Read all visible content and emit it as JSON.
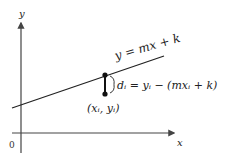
{
  "diagram": {
    "type": "least-squares-regression",
    "axes": {
      "x_label": "x",
      "y_label": "y",
      "origin_label": "0"
    },
    "line": {
      "equation": "y = mx + k"
    },
    "point": {
      "label": "(xᵢ, yᵢ)"
    },
    "residual": {
      "label": "dᵢ = yᵢ − (mxᵢ + k)"
    },
    "colors": {
      "stroke": "#222222",
      "axis": "#444444",
      "background": "#ffffff"
    }
  }
}
